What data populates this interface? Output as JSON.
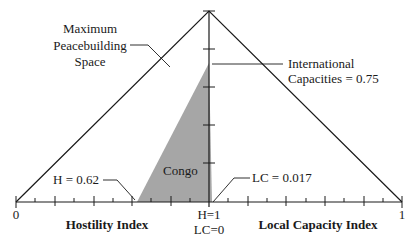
{
  "diagram": {
    "labels": {
      "max_space_line1": "Maximum",
      "max_space_line2": "Peacebuilding",
      "max_space_line3": "Space",
      "intl_line1": "International",
      "intl_line2": "Capacities = 0.75",
      "h_value": "H = 0.62",
      "lc_value": "LC = 0.017",
      "region": "Congo",
      "axis_left_title": "Hostility Index",
      "axis_right_title": "Local Capacity Index",
      "tick_left": "0",
      "tick_right": "1",
      "center_line1": "H=1",
      "center_line2": "LC=0"
    },
    "values": {
      "hostility_index": 0.62,
      "local_capacity_index": 0.017,
      "international_capacities": 0.75
    },
    "colors": {
      "line": "#1a1a1a",
      "fill": "#a6a6a6"
    }
  }
}
